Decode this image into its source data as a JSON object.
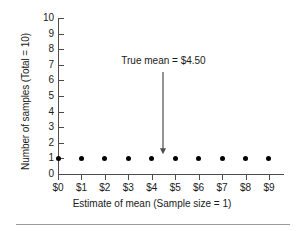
{
  "chart_data": {
    "type": "scatter",
    "title": "",
    "xlabel": "Estimate of mean (Sample size = 1)",
    "ylabel": "Number of samples (Total = 10)",
    "x_tick_labels": [
      "$0",
      "$1",
      "$2",
      "$3",
      "$4",
      "$5",
      "$6",
      "$7",
      "$8",
      "$9"
    ],
    "x_tick_values": [
      0,
      1,
      2,
      3,
      4,
      5,
      6,
      7,
      8,
      9
    ],
    "y_tick_labels": [
      "0",
      "1",
      "2",
      "3",
      "4",
      "5",
      "6",
      "7",
      "8",
      "9",
      "10"
    ],
    "y_tick_values": [
      0,
      1,
      2,
      3,
      4,
      5,
      6,
      7,
      8,
      9,
      10
    ],
    "xlim": [
      0,
      9.6
    ],
    "ylim": [
      0,
      10
    ],
    "grid": false,
    "legend": false,
    "x": [
      0,
      1,
      2,
      3,
      4,
      5,
      6,
      7,
      8,
      9
    ],
    "values": [
      1,
      1,
      1,
      1,
      1,
      1,
      1,
      1,
      1,
      1
    ],
    "series": [
      {
        "name": "Number of samples",
        "marker": "filled-circle",
        "color": "#000000",
        "points": [
          {
            "x": 0,
            "y": 1
          },
          {
            "x": 1,
            "y": 1
          },
          {
            "x": 2,
            "y": 1
          },
          {
            "x": 3,
            "y": 1
          },
          {
            "x": 4,
            "y": 1
          },
          {
            "x": 5,
            "y": 1
          },
          {
            "x": 6,
            "y": 1
          },
          {
            "x": 7,
            "y": 1
          },
          {
            "x": 8,
            "y": 1
          },
          {
            "x": 9,
            "y": 1
          }
        ]
      }
    ],
    "annotations": [
      {
        "text": "True mean = $4.50",
        "x": 4.5,
        "y": 1,
        "text_y": 7.1,
        "arrow": "down",
        "color": "#4d4d4d"
      }
    ],
    "axis_color": "#4d4d4d",
    "background": "#ffffff"
  }
}
